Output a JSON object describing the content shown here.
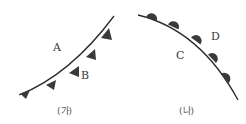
{
  "colors": {
    "line": "#2b2b2b",
    "symbol": "#3a3a3a",
    "text": "#3a3a3a",
    "background": "#ffffff"
  },
  "panels": [
    {
      "id": "ga",
      "caption": "(가)",
      "front_type": "cold-front",
      "symbol": "triangle",
      "labels": {
        "left_upper": "A",
        "right_lower": "B"
      }
    },
    {
      "id": "na",
      "caption": "(나)",
      "front_type": "warm-front",
      "symbol": "semicircle",
      "labels": {
        "left_lower": "C",
        "right_upper": "D"
      }
    }
  ]
}
